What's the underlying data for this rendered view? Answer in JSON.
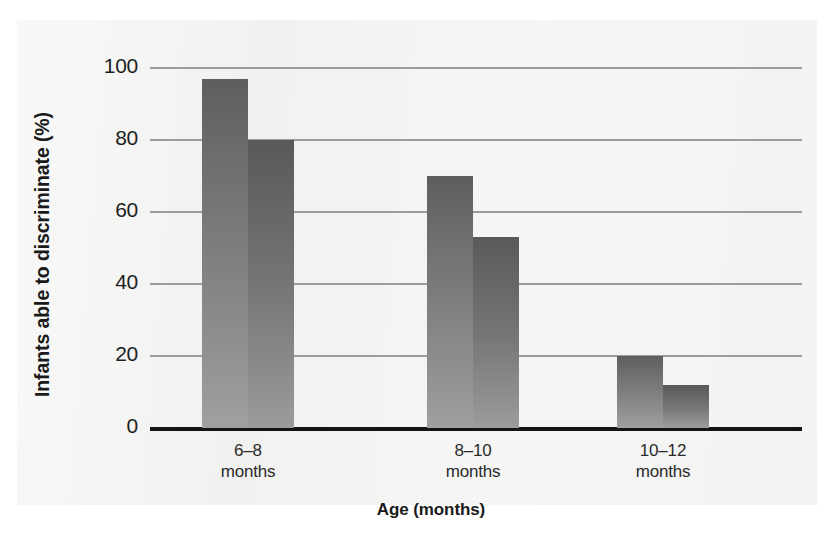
{
  "chart_data": {
    "type": "bar",
    "title": "",
    "xlabel": "Age (months)",
    "ylabel": "Infants able to discriminate (%)",
    "categories": [
      "6-8\nmonths",
      "8-10\nmonths",
      "10-12\nmonths"
    ],
    "category_parts": [
      {
        "range": "6–8",
        "unit": "months"
      },
      {
        "range": "8–10",
        "unit": "months"
      },
      {
        "range": "10–12",
        "unit": "months"
      }
    ],
    "series": [
      {
        "name": "series-a",
        "values": [
          97,
          70,
          20
        ]
      },
      {
        "name": "series-b",
        "values": [
          80,
          53,
          12
        ]
      }
    ],
    "ylim": [
      0,
      100
    ],
    "yticks": [
      0,
      20,
      40,
      60,
      80,
      100
    ],
    "ytick_labels": [
      "0",
      "20",
      "40",
      "60",
      "80",
      "100"
    ],
    "grid": true,
    "legend": "none",
    "bar_color_light": "#a0a0a0",
    "bar_color_dark": "#5e5e5e",
    "gridline_color": "#9b9b9b",
    "axis_color": "#141414",
    "panel_color": "#f1f1f0"
  }
}
